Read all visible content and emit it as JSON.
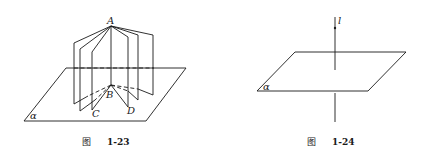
{
  "figures": [
    {
      "id": "fig-1-23",
      "caption_prefix": "图",
      "caption_number": "1-23",
      "labels": {
        "top_point": "A",
        "bottom_point": "B",
        "left_point": "C",
        "right_point": "D",
        "plane": "α"
      },
      "description": "Several half-planes sharing common edge AB standing on plane α"
    },
    {
      "id": "fig-1-24",
      "caption_prefix": "图",
      "caption_number": "1-24",
      "labels": {
        "line": "l",
        "plane": "α"
      },
      "description": "Line l perpendicular to plane α, passing through it"
    }
  ]
}
